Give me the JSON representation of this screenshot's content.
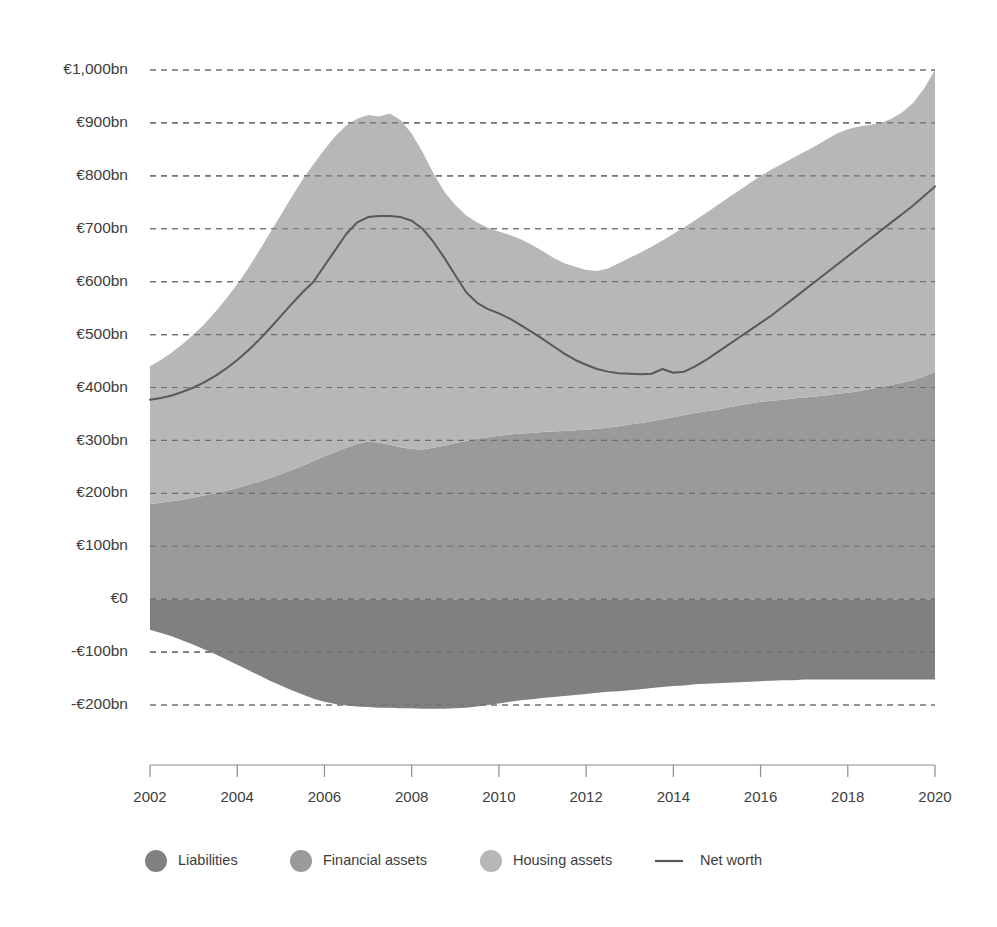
{
  "chart_data": {
    "type": "area",
    "title": "",
    "subtitle": "",
    "xlabel": "",
    "ylabel": "",
    "stacked": true,
    "grid": true,
    "legend_position": "bottom",
    "xlim": [
      2002,
      2020
    ],
    "ylim": [
      -200,
      1000
    ],
    "ytick_values": [
      1000,
      900,
      800,
      700,
      600,
      500,
      400,
      300,
      200,
      100,
      0,
      -100,
      -200
    ],
    "ytick_labels": [
      "€1,000bn",
      "€900bn",
      "€800bn",
      "€700bn",
      "€600bn",
      "€500bn",
      "€400bn",
      "€300bn",
      "€200bn",
      "€100bn",
      "€0",
      "-€100bn",
      "-€200bn"
    ],
    "xtick_values": [
      2002,
      2004,
      2006,
      2008,
      2010,
      2012,
      2014,
      2016,
      2018,
      2020
    ],
    "xtick_labels": [
      "2002",
      "2004",
      "2006",
      "2008",
      "2010",
      "2012",
      "2014",
      "2016",
      "2018",
      "2020"
    ],
    "x": [
      2002,
      2002.25,
      2002.5,
      2002.75,
      2003,
      2003.25,
      2003.5,
      2003.75,
      2004,
      2004.25,
      2004.5,
      2004.75,
      2005,
      2005.25,
      2005.5,
      2005.75,
      2006,
      2006.25,
      2006.5,
      2006.75,
      2007,
      2007.25,
      2007.5,
      2007.75,
      2008,
      2008.25,
      2008.5,
      2008.75,
      2009,
      2009.25,
      2009.5,
      2009.75,
      2010,
      2010.25,
      2010.5,
      2010.75,
      2011,
      2011.25,
      2011.5,
      2011.75,
      2012,
      2012.25,
      2012.5,
      2012.75,
      2013,
      2013.25,
      2013.5,
      2013.75,
      2014,
      2014.25,
      2014.5,
      2014.75,
      2015,
      2015.25,
      2015.5,
      2015.75,
      2016,
      2016.25,
      2016.5,
      2016.75,
      2017,
      2017.25,
      2017.5,
      2017.75,
      2018,
      2018.25,
      2018.5,
      2018.75,
      2019,
      2019.25,
      2019.5,
      2019.75,
      2020
    ],
    "series": [
      {
        "name": "Liabilities",
        "color": "#808080",
        "legend_marker": "circle",
        "note": "Plotted downward from €0 as negative values",
        "values": [
          -58,
          -64,
          -70,
          -78,
          -86,
          -95,
          -104,
          -114,
          -124,
          -134,
          -144,
          -154,
          -163,
          -172,
          -180,
          -188,
          -194,
          -198,
          -201,
          -203,
          -204,
          -205,
          -205,
          -206,
          -206,
          -207,
          -207,
          -207,
          -206,
          -205,
          -203,
          -200,
          -197,
          -194,
          -191,
          -189,
          -187,
          -185,
          -183,
          -181,
          -179,
          -177,
          -175,
          -174,
          -172,
          -170,
          -168,
          -166,
          -164,
          -163,
          -161,
          -160,
          -159,
          -158,
          -157,
          -156,
          -155,
          -154,
          -153,
          -153,
          -152,
          -152,
          -152,
          -152,
          -152,
          -152,
          -152,
          -152,
          -152,
          -152,
          -152,
          -152,
          -152
        ]
      },
      {
        "name": "Financial assets",
        "color": "#9a9a9a",
        "legend_marker": "circle",
        "values": [
          180,
          182,
          185,
          188,
          192,
          196,
          200,
          205,
          210,
          216,
          222,
          229,
          236,
          244,
          252,
          261,
          270,
          278,
          286,
          293,
          298,
          296,
          292,
          287,
          284,
          283,
          286,
          290,
          295,
          299,
          303,
          306,
          309,
          311,
          313,
          314,
          316,
          317,
          318,
          319,
          320,
          322,
          324,
          327,
          330,
          333,
          336,
          340,
          344,
          348,
          352,
          355,
          358,
          362,
          366,
          370,
          373,
          375,
          377,
          379,
          381,
          383,
          385,
          388,
          390,
          393,
          397,
          401,
          405,
          409,
          414,
          421,
          430
        ]
      },
      {
        "name": "Housing assets",
        "color": "#b7b7b7",
        "legend_marker": "circle",
        "values": [
          440,
          452,
          466,
          482,
          500,
          520,
          543,
          568,
          595,
          625,
          658,
          692,
          726,
          760,
          793,
          822,
          850,
          875,
          895,
          908,
          915,
          912,
          918,
          905,
          880,
          845,
          805,
          770,
          745,
          725,
          712,
          702,
          695,
          688,
          680,
          670,
          658,
          645,
          635,
          628,
          622,
          620,
          625,
          635,
          645,
          655,
          666,
          678,
          690,
          703,
          716,
          730,
          744,
          758,
          772,
          786,
          800,
          812,
          823,
          834,
          845,
          856,
          868,
          880,
          888,
          893,
          896,
          900,
          908,
          920,
          938,
          965,
          1000
        ]
      }
    ],
    "line_series": {
      "name": "Net worth",
      "color": "#595959",
      "legend_marker": "line",
      "values": [
        377,
        380,
        385,
        392,
        400,
        410,
        422,
        436,
        452,
        470,
        490,
        512,
        535,
        558,
        580,
        600,
        630,
        660,
        690,
        712,
        722,
        724,
        724,
        722,
        715,
        700,
        675,
        645,
        612,
        580,
        560,
        548,
        540,
        530,
        518,
        505,
        492,
        478,
        464,
        452,
        443,
        435,
        430,
        427,
        426,
        425,
        426,
        435,
        428,
        430,
        440,
        452,
        466,
        480,
        494,
        508,
        522,
        536,
        552,
        568,
        584,
        600,
        616,
        632,
        648,
        664,
        680,
        696,
        712,
        728,
        744,
        762,
        780,
        798
      ]
    },
    "legend": [
      {
        "label": "Liabilities",
        "color": "#808080",
        "marker": "circle"
      },
      {
        "label": "Financial assets",
        "color": "#9a9a9a",
        "marker": "circle"
      },
      {
        "label": "Housing assets",
        "color": "#b7b7b7",
        "marker": "circle"
      },
      {
        "label": "Net worth",
        "color": "#595959",
        "marker": "line"
      }
    ]
  }
}
